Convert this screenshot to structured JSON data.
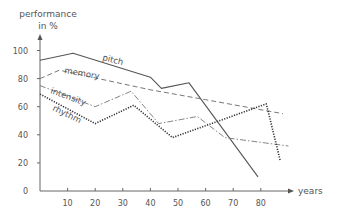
{
  "chart_data": {
    "type": "line",
    "title": "",
    "ylabel_line1": "performance",
    "ylabel_line2": "in %",
    "xlabel": "years",
    "xlim": [
      0,
      90
    ],
    "ylim": [
      0,
      100
    ],
    "xticks": [
      10,
      20,
      30,
      40,
      50,
      60,
      70,
      80
    ],
    "yticks": [
      0,
      20,
      40,
      60,
      80,
      100
    ],
    "grid": false,
    "legend": "inline labels",
    "series": [
      {
        "name": "pitch",
        "style": "solid",
        "x": [
          0,
          12,
          40,
          44,
          54,
          79
        ],
        "y": [
          93,
          98,
          81,
          73,
          77,
          10
        ]
      },
      {
        "name": "memory",
        "style": "dashed",
        "x": [
          0,
          7,
          40,
          60,
          88
        ],
        "y": [
          80,
          86,
          72,
          65,
          55
        ]
      },
      {
        "name": "intensity",
        "style": "dashdot",
        "x": [
          0,
          20,
          33,
          43,
          57,
          67,
          90
        ],
        "y": [
          75,
          60,
          71,
          48,
          53,
          38,
          32
        ]
      },
      {
        "name": "rhythm",
        "style": "dotted",
        "x": [
          0,
          20,
          34,
          48,
          82,
          87
        ],
        "y": [
          69,
          48,
          61,
          38,
          62,
          22
        ]
      }
    ]
  }
}
